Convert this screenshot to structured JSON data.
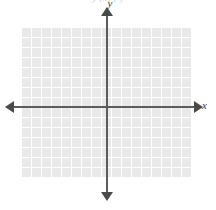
{
  "figure": {
    "type": "blank-coordinate-plane",
    "top_caption": "y (x)        (         )",
    "axes": {
      "x_label": "x",
      "y_label": "y",
      "x_axis_color": "#5c5c5c",
      "y_axis_color": "#5c5c5c",
      "arrowheads": {
        "left": "arrow-left",
        "right": "arrow-right",
        "up": "arrow-up",
        "down": "arrow-down"
      }
    },
    "grid": {
      "cell_color": "#e9e9e9",
      "line_color": "#ffffff",
      "cell_size_px": 10,
      "columns": 17,
      "rows": 15
    },
    "background_color": "#ffffff"
  },
  "chart_data": {
    "type": "scatter",
    "title": "",
    "xlabel": "x",
    "ylabel": "y",
    "x": [],
    "y": [],
    "series": [],
    "xlim": [
      -8.5,
      8.5
    ],
    "ylim": [
      -7.1,
      7.9
    ],
    "grid": true,
    "legend": "none",
    "annotations": [],
    "note": "Empty Cartesian grid with no plotted data; 17 columns by 15 rows of grid squares, axes drawn with arrowheads at both ends."
  }
}
